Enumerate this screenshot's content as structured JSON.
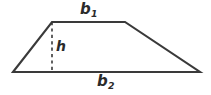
{
  "figure": {
    "type": "trapezoid-geometry-diagram",
    "background_color": "#ffffff",
    "stroke_color": "#3a3a3a",
    "label_color": "#2b2b2b",
    "labels": {
      "top_base": {
        "base": "b",
        "subscript": "1",
        "full": "b1"
      },
      "bottom_base": {
        "base": "b",
        "subscript": "2",
        "full": "b2"
      },
      "height": {
        "base": "h",
        "full": "h"
      }
    },
    "geometry": {
      "bottom_left": [
        13,
        72
      ],
      "bottom_right": [
        200,
        72
      ],
      "top_left": [
        52,
        22
      ],
      "top_right": [
        125,
        22
      ],
      "height_line_x": 52,
      "height_line_top_y": 22,
      "height_line_bottom_y": 72,
      "height_line_style": "dashed"
    }
  }
}
